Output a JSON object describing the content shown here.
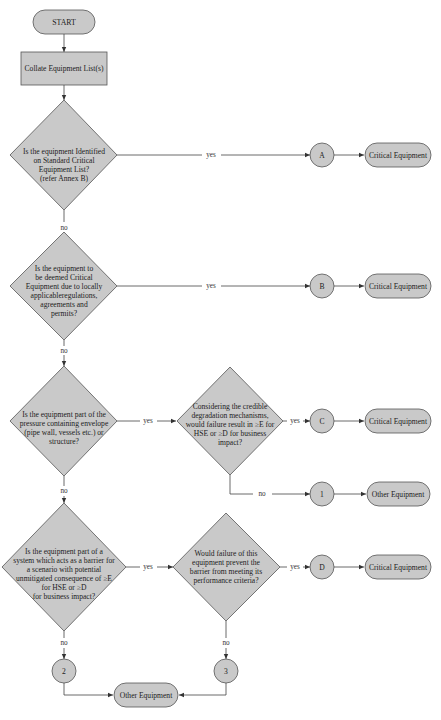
{
  "start": "START",
  "collate": "Collate Equipment List(s)",
  "q1": [
    "Is the equipment Identified",
    "on Standard Critical",
    "Equipment List?",
    "(refer Annex B)"
  ],
  "q2": [
    "Is the equipment to",
    "be deemed Critical",
    "Equipment due to locally",
    "applicableregulations,",
    "agreements and",
    "permits?"
  ],
  "q3": [
    "Is the equipment part of the",
    "pressure containing envelope",
    "(pipe wall, vessels etc.) or",
    "structure?"
  ],
  "q3b": [
    "Considering the credible",
    "degradation mechanisms,",
    "would failure result in ≥E for",
    "HSE or ≥D for business",
    "impact?"
  ],
  "q4": [
    "Is the equipment part of a",
    "system which acts as a barrier for",
    "a scenario with potential",
    "unmitigated consequence of ≥E",
    "for HSE or ≥D",
    "for business impact?"
  ],
  "q4b": [
    "Would failure of this",
    "equipment prevent the",
    "barrier from meeting its",
    "performance criteria?"
  ],
  "labels": {
    "yes": "yes",
    "no": "no"
  },
  "connectors": {
    "a": "A",
    "b": "B",
    "c": "C",
    "d": "D",
    "one": "1",
    "two": "2",
    "three": "3"
  },
  "outcomes": {
    "critical": "Critical Equipment",
    "other": "Other Equipment"
  }
}
